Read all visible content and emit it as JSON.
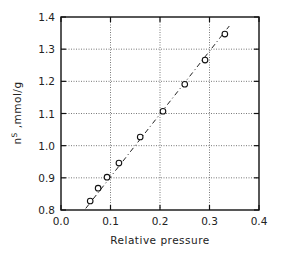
{
  "chart_data": {
    "type": "scatter",
    "title": "",
    "xlabel": "Relative pressure",
    "ylabel": "n^s ,mmol/g",
    "ylabel_parts": {
      "main": "n",
      "sup": "S",
      "rest": " ,mmol/g"
    },
    "xlim": [
      0.0,
      0.4
    ],
    "ylim": [
      0.8,
      1.4
    ],
    "x_ticks": [
      "0.0",
      "0.1",
      "0.2",
      "0.3",
      "0.4"
    ],
    "y_ticks": [
      "0.8",
      "0.9",
      "1.0",
      "1.1",
      "1.2",
      "1.3",
      "1.4"
    ],
    "grid": true,
    "grid_style": "dotted",
    "legend": null,
    "series": [
      {
        "name": "data",
        "marker": "open-circle",
        "x": [
          0.059,
          0.075,
          0.093,
          0.117,
          0.16,
          0.206,
          0.25,
          0.291,
          0.331
        ],
        "y": [
          0.828,
          0.868,
          0.902,
          0.946,
          1.027,
          1.107,
          1.191,
          1.266,
          1.347
        ]
      },
      {
        "name": "linear fit",
        "line_style": "dash-dot",
        "x": [
          0.05,
          0.34
        ],
        "y": [
          0.805,
          1.372
        ]
      }
    ]
  }
}
